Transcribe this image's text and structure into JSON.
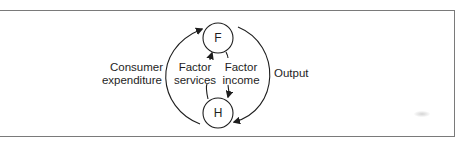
{
  "diagram": {
    "type": "circular-flow",
    "nodes": {
      "firms": {
        "label": "F"
      },
      "households": {
        "label": "H"
      }
    },
    "flows": {
      "consumer_expenditure": {
        "line1": "Consumer",
        "line2": "expenditure",
        "from": "H",
        "to": "F"
      },
      "factor_services": {
        "line1": "Factor",
        "line2": "services",
        "from": "H",
        "to": "F"
      },
      "factor_income": {
        "line1": "Factor",
        "line2": "income",
        "from": "F",
        "to": "H"
      },
      "output": {
        "label": "Output",
        "from": "F",
        "to": "H"
      }
    },
    "colors": {
      "stroke": "#1e1e1e",
      "frame": "#7a7a7a",
      "background": "#ffffff"
    }
  }
}
